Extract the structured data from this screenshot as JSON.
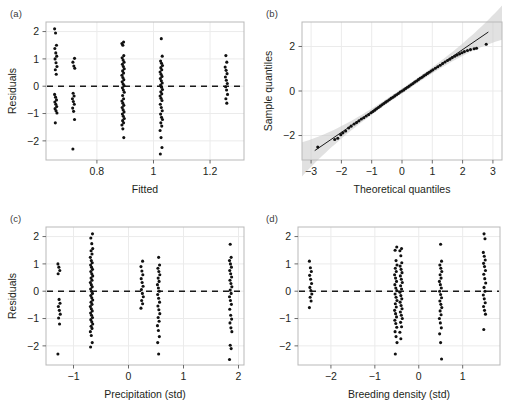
{
  "figure": {
    "background": "#ffffff",
    "point_color": "#111111",
    "frame_color": "#b9b9b9",
    "grid_color": "#ebebeb",
    "band_color": "#c9c9c9",
    "dash_color": "#1a1a1a"
  },
  "panels": [
    {
      "key": "a",
      "label": "(a)",
      "xlabel": "Fitted",
      "ylabel": "Residuals",
      "xticks": [
        "0.8",
        "1.0",
        "1.2"
      ],
      "yticks": [
        "2",
        "1",
        "0",
        "-1",
        "-2"
      ]
    },
    {
      "key": "b",
      "label": "(b)",
      "xlabel": "Theoretical quantiles",
      "ylabel": "Sample quantiles",
      "xticks": [
        "-3",
        "-2",
        "-1",
        "0",
        "1",
        "2",
        "3"
      ],
      "yticks": [
        "2",
        "0",
        "-2"
      ]
    },
    {
      "key": "c",
      "label": "(c)",
      "xlabel": "Precipitation (std)",
      "ylabel": "Residuals",
      "xticks": [
        "-1",
        "0",
        "1",
        "2"
      ],
      "yticks": [
        "2",
        "1",
        "0",
        "-1",
        "-2"
      ]
    },
    {
      "key": "d",
      "label": "(d)",
      "xlabel": "Breeding density (std)",
      "ylabel": "",
      "xticks": [
        "-2",
        "-1",
        "0",
        "1"
      ],
      "yticks": [
        "2",
        "1",
        "0",
        "-1",
        "-2"
      ]
    }
  ],
  "chart_data": [
    {
      "type": "scatter",
      "panel": "a",
      "title": "(a)",
      "xlabel": "Fitted",
      "ylabel": "Residuals",
      "xlim": [
        0.62,
        1.32
      ],
      "ylim": [
        -2.7,
        2.35
      ],
      "xticks": [
        0.8,
        1.0,
        1.2
      ],
      "yticks": [
        -2,
        -1,
        0,
        1,
        2
      ],
      "grid": true,
      "reference_line": {
        "type": "hline",
        "y": 0,
        "style": "dashed"
      },
      "clusters": [
        {
          "x": 0.655,
          "y": [
            2.1,
            1.95,
            1.5,
            1.38,
            1.22,
            1.1,
            1.0,
            0.86,
            0.72,
            0.6,
            0.44,
            -0.3,
            -0.4,
            -0.5,
            -0.58,
            -0.66,
            -0.74,
            -0.82,
            -0.9,
            -0.98,
            -1.34
          ]
        },
        {
          "x": 0.718,
          "y": [
            1.02,
            0.88,
            0.74,
            0.66,
            -0.26,
            -0.36,
            -0.46,
            -0.56,
            -0.66,
            -0.8,
            -0.92,
            -1.22,
            -2.3
          ]
        },
        {
          "x": 0.893,
          "y": [
            1.62,
            1.56,
            1.5,
            1.12,
            1.04,
            0.96,
            0.88,
            0.8,
            0.72,
            0.64,
            0.56,
            0.48,
            0.4,
            0.32,
            0.24,
            0.16,
            0.08,
            0.02,
            -0.06,
            -0.14,
            -0.22,
            -0.34,
            -0.46,
            -0.54,
            -0.62,
            -0.7,
            -0.78,
            -0.86,
            -0.94,
            -1.02,
            -1.1,
            -1.18,
            -1.26,
            -1.34,
            -1.42,
            -1.56,
            -1.88
          ]
        },
        {
          "x": 1.028,
          "y": [
            1.74,
            1.1,
            0.92,
            0.84,
            0.76,
            0.68,
            0.6,
            0.52,
            0.44,
            0.36,
            0.28,
            0.2,
            0.12,
            0.04,
            -0.04,
            -0.12,
            -0.2,
            -0.28,
            -0.36,
            -0.44,
            -0.52,
            -0.66,
            -0.78,
            -0.9,
            -1.02,
            -1.14,
            -1.22,
            -1.34,
            -1.46,
            -1.62,
            -1.88,
            -2.24,
            -2.48
          ]
        },
        {
          "x": 1.258,
          "y": [
            1.12,
            0.88,
            0.7,
            0.58,
            0.46,
            0.34,
            0.22,
            0.1,
            -0.02,
            -0.14,
            -0.3,
            -0.46,
            -0.62
          ]
        }
      ]
    },
    {
      "type": "scatter",
      "panel": "b",
      "title": "(b)",
      "xlabel": "Theoretical quantiles",
      "ylabel": "Sample quantiles",
      "xlim": [
        -3.3,
        3.3
      ],
      "ylim": [
        -3.1,
        3.1
      ],
      "xticks": [
        -3,
        -2,
        -1,
        0,
        1,
        2,
        3
      ],
      "yticks": [
        -2,
        0,
        2
      ],
      "grid": true,
      "reference_line": {
        "type": "qq-line",
        "slope": 0.93,
        "intercept": 0.0
      },
      "confidence_band": true,
      "points": [
        [
          -2.78,
          -2.52
        ],
        [
          -2.22,
          -2.18
        ],
        [
          -2.12,
          -2.12
        ],
        [
          -2.02,
          -1.96
        ],
        [
          -1.95,
          -1.88
        ],
        [
          -1.86,
          -1.8
        ],
        [
          -1.76,
          -1.66
        ],
        [
          -1.68,
          -1.58
        ],
        [
          -1.58,
          -1.48
        ],
        [
          -1.5,
          -1.42
        ],
        [
          -1.42,
          -1.34
        ],
        [
          -1.34,
          -1.26
        ],
        [
          -1.26,
          -1.2
        ],
        [
          -1.18,
          -1.12
        ],
        [
          -1.1,
          -1.06
        ],
        [
          -1.02,
          -0.98
        ],
        [
          -0.96,
          -0.92
        ],
        [
          -0.9,
          -0.86
        ],
        [
          -0.84,
          -0.8
        ],
        [
          -0.78,
          -0.74
        ],
        [
          -0.72,
          -0.68
        ],
        [
          -0.66,
          -0.62
        ],
        [
          -0.6,
          -0.56
        ],
        [
          -0.54,
          -0.5
        ],
        [
          -0.48,
          -0.45
        ],
        [
          -0.42,
          -0.39
        ],
        [
          -0.36,
          -0.33
        ],
        [
          -0.3,
          -0.28
        ],
        [
          -0.24,
          -0.22
        ],
        [
          -0.18,
          -0.17
        ],
        [
          -0.12,
          -0.11
        ],
        [
          -0.06,
          -0.05
        ],
        [
          0.0,
          0.0
        ],
        [
          0.06,
          0.05
        ],
        [
          0.12,
          0.11
        ],
        [
          0.18,
          0.17
        ],
        [
          0.24,
          0.22
        ],
        [
          0.3,
          0.28
        ],
        [
          0.36,
          0.34
        ],
        [
          0.42,
          0.4
        ],
        [
          0.48,
          0.45
        ],
        [
          0.54,
          0.51
        ],
        [
          0.6,
          0.57
        ],
        [
          0.66,
          0.62
        ],
        [
          0.72,
          0.68
        ],
        [
          0.78,
          0.73
        ],
        [
          0.84,
          0.79
        ],
        [
          0.9,
          0.84
        ],
        [
          0.96,
          0.9
        ],
        [
          1.02,
          0.95
        ],
        [
          1.1,
          1.02
        ],
        [
          1.18,
          1.09
        ],
        [
          1.26,
          1.16
        ],
        [
          1.34,
          1.23
        ],
        [
          1.42,
          1.3
        ],
        [
          1.5,
          1.37
        ],
        [
          1.58,
          1.43
        ],
        [
          1.66,
          1.5
        ],
        [
          1.74,
          1.56
        ],
        [
          1.82,
          1.62
        ],
        [
          1.9,
          1.67
        ],
        [
          1.98,
          1.72
        ],
        [
          2.06,
          1.77
        ],
        [
          2.16,
          1.82
        ],
        [
          2.26,
          1.86
        ],
        [
          2.38,
          1.9
        ],
        [
          2.46,
          1.92
        ],
        [
          2.78,
          2.1
        ]
      ]
    },
    {
      "type": "scatter",
      "panel": "c",
      "title": "(c)",
      "xlabel": "Precipitation (std)",
      "ylabel": "Residuals",
      "xlim": [
        -1.5,
        2.1
      ],
      "ylim": [
        -2.7,
        2.35
      ],
      "xticks": [
        -1,
        0,
        1,
        2
      ],
      "yticks": [
        -2,
        -1,
        0,
        1,
        2
      ],
      "grid": true,
      "reference_line": {
        "type": "hline",
        "y": 0,
        "style": "dashed"
      },
      "clusters": [
        {
          "x": -1.26,
          "y": [
            1.0,
            0.88,
            0.76,
            0.64,
            -0.3,
            -0.44,
            -0.56,
            -0.7,
            -0.84,
            -0.98,
            -1.2,
            -2.3
          ]
        },
        {
          "x": -0.67,
          "y": [
            2.1,
            1.95,
            1.74,
            1.56,
            1.48,
            1.36,
            1.24,
            1.12,
            1.04,
            0.96,
            0.88,
            0.8,
            0.72,
            0.64,
            0.56,
            0.48,
            0.4,
            0.32,
            0.24,
            0.16,
            0.08,
            0.0,
            -0.08,
            -0.16,
            -0.24,
            -0.32,
            -0.4,
            -0.48,
            -0.56,
            -0.64,
            -0.72,
            -0.8,
            -0.88,
            -0.96,
            -1.04,
            -1.12,
            -1.2,
            -1.28,
            -1.36,
            -1.48,
            -1.62,
            -1.88,
            -2.04
          ]
        },
        {
          "x": 0.25,
          "y": [
            1.1,
            0.9,
            0.74,
            0.6,
            0.46,
            0.32,
            0.18,
            0.06,
            -0.08,
            -0.2,
            -0.34,
            -0.46,
            -0.62
          ]
        },
        {
          "x": 0.55,
          "y": [
            1.24,
            0.96,
            0.84,
            0.72,
            0.6,
            0.48,
            0.36,
            0.24,
            0.12,
            0.0,
            -0.12,
            -0.26,
            -0.4,
            -0.54,
            -0.68,
            -0.82,
            -0.96,
            -1.1,
            -1.26,
            -1.44,
            -1.66,
            -1.88,
            -2.3
          ]
        },
        {
          "x": 1.86,
          "y": [
            1.72,
            1.24,
            1.12,
            1.0,
            0.88,
            0.76,
            0.64,
            0.52,
            0.4,
            0.28,
            0.16,
            0.04,
            -0.08,
            -0.2,
            -0.34,
            -0.48,
            -0.66,
            -0.88,
            -1.02,
            -1.16,
            -1.34,
            -1.48,
            -1.98,
            -2.1,
            -2.5
          ]
        }
      ]
    },
    {
      "type": "scatter",
      "panel": "d",
      "title": "(d)",
      "xlabel": "Breeding density (std)",
      "ylabel": "",
      "xlim": [
        -2.75,
        1.85
      ],
      "ylim": [
        -2.7,
        2.35
      ],
      "xticks": [
        -2,
        -1,
        0,
        1
      ],
      "yticks": [
        -2,
        -1,
        0,
        1,
        2
      ],
      "grid": true,
      "reference_line": {
        "type": "hline",
        "y": 0,
        "style": "dashed"
      },
      "clusters": [
        {
          "x": -2.46,
          "y": [
            1.1,
            0.86,
            0.72,
            0.58,
            0.44,
            0.28,
            0.14,
            0.02,
            -0.1,
            -0.22,
            -0.36,
            -0.6
          ]
        },
        {
          "x": -0.52,
          "y": [
            1.62,
            1.5,
            1.12,
            0.96,
            0.84,
            0.72,
            0.6,
            0.48,
            0.36,
            0.24,
            0.12,
            0.02,
            -0.1,
            -0.22,
            -0.34,
            -0.46,
            -0.58,
            -0.7,
            -0.82,
            -0.94,
            -1.06,
            -1.18,
            -1.32,
            -1.48,
            -1.66,
            -1.88,
            -2.3
          ]
        },
        {
          "x": -0.4,
          "y": [
            1.56,
            1.48,
            1.3,
            1.04,
            0.92,
            0.8,
            0.68,
            0.56,
            0.44,
            0.32,
            0.2,
            0.08,
            -0.04,
            -0.16,
            -0.28,
            -0.4,
            -0.52,
            -0.64,
            -0.76,
            -0.88,
            -1.0,
            -1.14,
            -1.3,
            -1.5,
            -1.74
          ]
        },
        {
          "x": 0.5,
          "y": [
            1.72,
            1.1,
            0.96,
            0.84,
            0.72,
            0.6,
            0.48,
            0.36,
            0.24,
            0.12,
            0.0,
            -0.12,
            -0.24,
            -0.36,
            -0.48,
            -0.6,
            -0.72,
            -0.86,
            -1.0,
            -1.16,
            -1.34,
            -1.56,
            -1.88,
            -2.48
          ]
        },
        {
          "x": 1.5,
          "y": [
            2.1,
            1.92,
            1.42,
            1.28,
            1.14,
            1.02,
            0.9,
            0.76,
            0.62,
            0.46,
            0.3,
            0.14,
            0.0,
            -0.14,
            -0.28,
            -0.42,
            -0.56,
            -0.7,
            -0.84,
            -1.4
          ]
        }
      ]
    }
  ]
}
